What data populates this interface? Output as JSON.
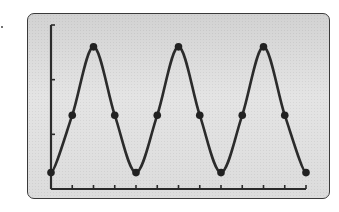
{
  "chart_data": {
    "type": "line",
    "title": "",
    "xlabel": "",
    "ylabel": "",
    "x": [
      0,
      1,
      2,
      3,
      4,
      5,
      6,
      7,
      8,
      9,
      10,
      11,
      12
    ],
    "series": [
      {
        "name": "wave",
        "values": [
          0.3,
          1.35,
          2.6,
          1.35,
          0.3,
          1.35,
          2.6,
          1.35,
          0.3,
          1.35,
          2.6,
          1.35,
          0.3
        ],
        "markers": true,
        "smooth": true
      }
    ],
    "xlim": [
      0,
      12
    ],
    "ylim": [
      0,
      3
    ],
    "x_ticks": [
      1,
      2,
      3,
      4,
      5,
      6,
      7,
      8,
      9,
      10,
      11,
      12
    ],
    "y_ticks": [
      1,
      2,
      3
    ],
    "tick_labels_shown": false,
    "grid": false,
    "legend": null
  },
  "style": {
    "line_color": "#2b2b2b",
    "marker_color": "#222222",
    "panel_border_color": "#3a3a3a",
    "panel_fill_top": "#d2d2d2",
    "panel_fill_bottom": "#dcdcdc",
    "axis_color": "#2b2b2b"
  }
}
